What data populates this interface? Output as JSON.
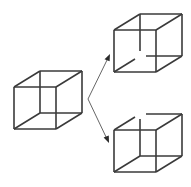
{
  "figure": {
    "background_color": "#ffffff",
    "line_color": "#3a3a3a",
    "arrow_color": "#555555",
    "line_width": 1.6,
    "arrow_width": 0.9,
    "width": 191,
    "height": 187
  },
  "chart_data": {
    "type": "diagram",
    "xlabel": "",
    "ylabel": "",
    "nodes": [
      {
        "id": "ambiguous-cube",
        "label": "Ambiguous Necker cube",
        "position": [
          48,
          100
        ],
        "occlusion": "none"
      },
      {
        "id": "interpretation-cube-top",
        "label": "Interpretation 1",
        "position": [
          148,
          43
        ],
        "occlusion": "back-lower-left-vertex-hidden"
      },
      {
        "id": "interpretation-cube-bottom",
        "label": "Interpretation 2",
        "position": [
          148,
          143
        ],
        "occlusion": "back-upper-right-vertex-hidden"
      }
    ],
    "edges": [
      {
        "from": "ambiguous-cube",
        "to": "interpretation-cube-top",
        "style": "arrow"
      },
      {
        "from": "ambiguous-cube",
        "to": "interpretation-cube-bottom",
        "style": "arrow"
      }
    ],
    "legend": [],
    "annotations": [],
    "grid": false
  },
  "cubes": {
    "left": {
      "name": "ambiguous-necker-cube",
      "front_square": {
        "x": 14,
        "y": 87,
        "size": 42
      },
      "offset": {
        "dx": 26,
        "dy": -16
      },
      "gaps": []
    },
    "top_right": {
      "name": "interpretation-cube-one",
      "front_square": {
        "x": 114,
        "y": 30,
        "size": 42
      },
      "offset": {
        "dx": 26,
        "dy": -16
      },
      "gaps": [
        "back-vertical-top",
        "back-horizontal-left",
        "back-diagonal"
      ]
    },
    "bottom_right": {
      "name": "interpretation-cube-two",
      "front_square": {
        "x": 114,
        "y": 130,
        "size": 42
      },
      "offset": {
        "dx": 26,
        "dy": -16
      },
      "gaps": [
        "back-vertical-bottom",
        "back-horizontal-right",
        "back-diagonal"
      ]
    }
  },
  "arrows": {
    "origin": [
      88,
      99
    ],
    "top_target": [
      110,
      56
    ],
    "bottom_target": [
      109,
      141
    ]
  }
}
